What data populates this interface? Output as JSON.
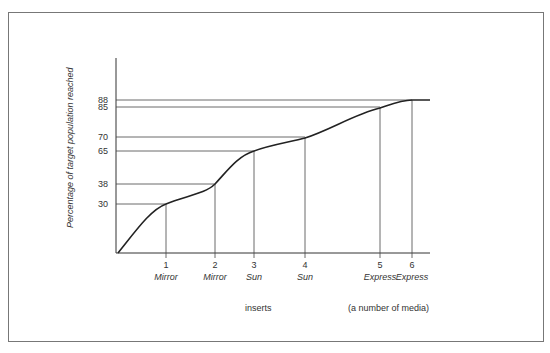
{
  "chart_data": {
    "type": "line",
    "title": "",
    "xlabel": "inserts",
    "xlabel_secondary": "(a number of media)",
    "ylabel": "Percentage of target population reached",
    "x": [
      1,
      2,
      3,
      4,
      5,
      6
    ],
    "categories": [
      "1 Mirror",
      "2 Mirror",
      "3 Sun",
      "4 Sun",
      "5 Express",
      "6 Express"
    ],
    "x_tick_numbers": [
      "1",
      "2",
      "3",
      "4",
      "5",
      "6"
    ],
    "x_tick_media": [
      "Mirror",
      "Mirror",
      "Sun",
      "Sun",
      "Express",
      "Express"
    ],
    "series": [
      {
        "name": "Cumulative reach",
        "values": [
          30,
          38,
          65,
          70,
          85,
          88
        ]
      }
    ],
    "y_ticks": [
      30,
      38,
      65,
      70,
      85,
      88
    ],
    "curve_start": {
      "x": 0,
      "y": 0
    },
    "grid": false,
    "legend": "none"
  }
}
